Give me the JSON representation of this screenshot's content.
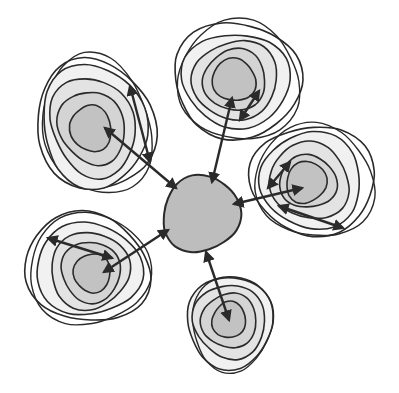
{
  "diagram": {
    "type": "hub-and-spoke contour diagram",
    "colors": {
      "stroke": "#2a2a2a",
      "ring_fills": [
        "#ffffff",
        "#f1f1f1",
        "#e3e3e3",
        "#d4d4d4",
        "#c2c2c2"
      ],
      "hub_fill": "#bdbdbd",
      "background": "#ffffff"
    },
    "hub": {
      "cx": 201,
      "cy": 214,
      "rx": 39,
      "ry": 38,
      "label": ""
    },
    "clusters": [
      {
        "name": "upper-left",
        "cx": 95,
        "cy": 125,
        "rot": -20,
        "rings": [
          [
            57,
            68
          ],
          [
            52,
            62
          ],
          [
            42,
            50
          ],
          [
            32,
            38
          ],
          [
            20,
            24
          ]
        ],
        "core": [
          90,
          127
        ],
        "arrows": [
          [
            105,
            128,
            176,
            188
          ],
          [
            130,
            86,
            150,
            162
          ]
        ]
      },
      {
        "name": "top",
        "cx": 237,
        "cy": 80,
        "rot": 0,
        "rings": [
          [
            65,
            57
          ],
          [
            53,
            48
          ],
          [
            42,
            40
          ],
          [
            32,
            30
          ],
          [
            22,
            21
          ]
        ],
        "core": [
          234,
          80
        ],
        "arrows": [
          [
            232,
            98,
            212,
            182
          ],
          [
            240,
            120,
            259,
            91
          ]
        ]
      },
      {
        "name": "right",
        "cx": 313,
        "cy": 180,
        "rot": 15,
        "rings": [
          [
            62,
            55
          ],
          [
            52,
            47
          ],
          [
            40,
            38
          ],
          [
            28,
            27
          ],
          [
            20,
            21
          ]
        ],
        "core": [
          307,
          184
        ],
        "arrows": [
          [
            302,
            188,
            234,
            204
          ],
          [
            290,
            162,
            268,
            188
          ],
          [
            279,
            206,
            343,
            228
          ]
        ]
      },
      {
        "name": "lower-left",
        "cx": 87,
        "cy": 268,
        "rot": 10,
        "rings": [
          [
            62,
            55
          ],
          [
            52,
            47
          ],
          [
            40,
            38
          ],
          [
            30,
            30
          ],
          [
            18,
            20
          ]
        ],
        "core": [
          93,
          272
        ],
        "arrows": [
          [
            104,
            272,
            168,
            230
          ],
          [
            48,
            238,
            112,
            258
          ]
        ]
      },
      {
        "name": "bottom",
        "cx": 230,
        "cy": 322,
        "rot": 0,
        "rings": [
          [
            44,
            45
          ],
          [
            36,
            37
          ],
          [
            27,
            28
          ],
          [
            17,
            18
          ]
        ],
        "core": [
          229,
          320
        ],
        "arrows": [
          [
            229,
            320,
            206,
            252
          ]
        ]
      }
    ]
  }
}
